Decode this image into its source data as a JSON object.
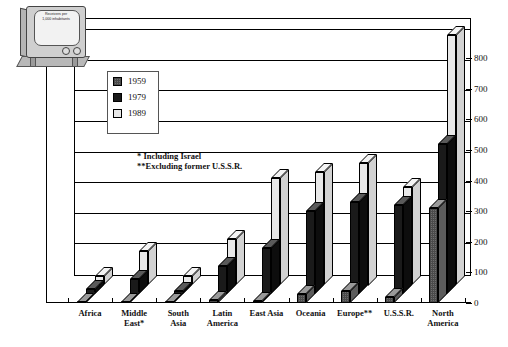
{
  "chart_data": {
    "type": "bar",
    "title": "",
    "subtitle": "",
    "xlabel": "",
    "ylabel": "Receivers per 1,000 inhabitants",
    "ylim": [
      0,
      850
    ],
    "ytick_step": 100,
    "yticks": [
      "0",
      "100",
      "200",
      "300",
      "400",
      "500",
      "600",
      "700",
      "800"
    ],
    "grid": true,
    "legend_position": "upper-left-inside",
    "categories": [
      "Africa",
      "Middle East*",
      "South Asia",
      "Latin America",
      "East Asia",
      "Oceania",
      "Europe**",
      "U.S.S.R.",
      "North America"
    ],
    "series": [
      {
        "name": "1959",
        "color": "#6e6e6e",
        "values": [
          2,
          4,
          1,
          10,
          6,
          30,
          40,
          20,
          310
        ]
      },
      {
        "name": "1979",
        "color": "#1a1a1a",
        "values": [
          15,
          50,
          10,
          90,
          150,
          270,
          300,
          290,
          490
        ]
      },
      {
        "name": "1989",
        "color": "#e8e8e8",
        "values": [
          30,
          110,
          30,
          150,
          350,
          370,
          400,
          320,
          815
        ]
      }
    ],
    "annotations": [
      "* Including Israel",
      "**Excluding former U.S.S.R."
    ]
  },
  "legend": {
    "items": [
      {
        "label": "1959",
        "swatch": "hatched-gray"
      },
      {
        "label": "1979",
        "swatch": "black"
      },
      {
        "label": "1989",
        "swatch": "white"
      }
    ]
  },
  "icon": {
    "name": "television-icon",
    "screen_line1": "Receivers per",
    "screen_line2": "1,000 inhabitants"
  },
  "footnotes": {
    "israel": "* Including Israel",
    "ussr": "**Excluding former U.S.S.R."
  }
}
